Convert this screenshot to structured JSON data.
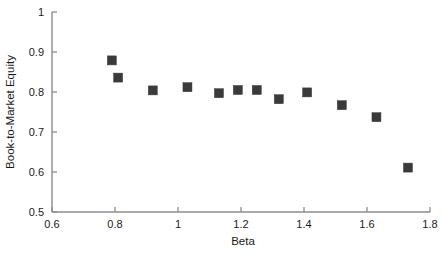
{
  "chart_data": {
    "type": "scatter",
    "title": "",
    "xlabel": "Beta",
    "ylabel": "Book-to-Market Equity",
    "xlim": [
      0.6,
      1.8
    ],
    "ylim": [
      0.5,
      1.0
    ],
    "xticks": [
      0.6,
      0.8,
      1.0,
      1.2,
      1.4,
      1.6,
      1.8
    ],
    "xtick_labels": [
      "0.6",
      "0.8",
      "1",
      "1.2",
      "1.4",
      "1.6",
      "1.8"
    ],
    "yticks": [
      0.5,
      0.6,
      0.7,
      0.8,
      0.9,
      1.0
    ],
    "ytick_labels": [
      "0.5",
      "0.6",
      "0.7",
      "0.8",
      "0.9",
      "1"
    ],
    "grid": false,
    "legend": false,
    "marker": "square",
    "marker_color": "#3a3a3a",
    "axis_color": "#8c8c8c",
    "series": [
      {
        "name": "Portfolios",
        "points": [
          {
            "x": 0.79,
            "y": 0.879
          },
          {
            "x": 0.81,
            "y": 0.836
          },
          {
            "x": 0.92,
            "y": 0.804
          },
          {
            "x": 1.03,
            "y": 0.812
          },
          {
            "x": 1.13,
            "y": 0.797
          },
          {
            "x": 1.19,
            "y": 0.805
          },
          {
            "x": 1.25,
            "y": 0.805
          },
          {
            "x": 1.32,
            "y": 0.782
          },
          {
            "x": 1.41,
            "y": 0.799
          },
          {
            "x": 1.52,
            "y": 0.767
          },
          {
            "x": 1.63,
            "y": 0.737
          },
          {
            "x": 1.73,
            "y": 0.611
          }
        ]
      }
    ]
  }
}
